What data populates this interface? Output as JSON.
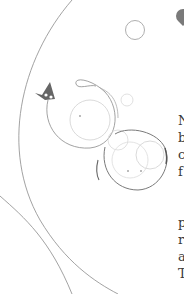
{
  "content": {
    "paragraph_1_lines": [
      "N",
      "b",
      "c",
      "f"
    ],
    "paragraph_2_lines": [
      "p",
      "r",
      "a",
      "T"
    ]
  },
  "decoration": {
    "line_color": "#8a8a8a",
    "heart_color": "#7a7a7a"
  }
}
